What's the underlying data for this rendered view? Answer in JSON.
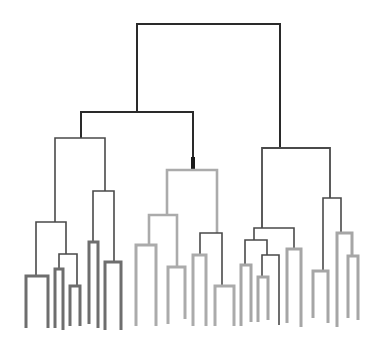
{
  "diagram": {
    "type": "dendrogram",
    "width": 385,
    "height": 350,
    "colors": {
      "root": "#2a2a2a",
      "internal": "#4a4a4a",
      "left_leaf": "#6e6e6e",
      "middle_leaf": "#ababab",
      "right_leaf": "#a6a6a6",
      "stub": "#1a1a1a"
    },
    "links": [
      {
        "id": "root",
        "x1": 137,
        "x2": 280,
        "y": 24,
        "yl": 112,
        "yr": 148,
        "color": "root",
        "w": 2
      },
      {
        "id": "L",
        "x1": 81,
        "x2": 193,
        "y": 112,
        "yl": 138,
        "yr": 170,
        "color": "root",
        "w": 2
      },
      {
        "id": "stub",
        "x1": 193,
        "x2": 193,
        "y": 157,
        "yl": 170,
        "yr": 170,
        "color": "stub",
        "w": 4
      },
      {
        "id": "L1",
        "x1": 55,
        "x2": 105,
        "y": 138,
        "yl": 222,
        "yr": 191,
        "color": "internal",
        "w": 1.6
      },
      {
        "id": "L1a",
        "x1": 36,
        "x2": 66,
        "y": 222,
        "yl": 276,
        "yr": 254,
        "color": "internal",
        "w": 1.6
      },
      {
        "id": "L1a1",
        "x1": 26,
        "x2": 48,
        "y": 276,
        "yl": 328,
        "yr": 328,
        "color": "left_leaf",
        "w": 3
      },
      {
        "id": "L1a2",
        "x1": 59,
        "x2": 77,
        "y": 254,
        "yl": 269,
        "yr": 286,
        "color": "internal",
        "w": 1.6
      },
      {
        "id": "L1a2a",
        "x1": 55,
        "x2": 63,
        "y": 269,
        "yl": 328,
        "yr": 330,
        "color": "left_leaf",
        "w": 3
      },
      {
        "id": "L1a2b",
        "x1": 70,
        "x2": 80,
        "y": 286,
        "yl": 326,
        "yr": 326,
        "color": "left_leaf",
        "w": 3
      },
      {
        "id": "L1b",
        "x1": 93,
        "x2": 114,
        "y": 191,
        "yl": 242,
        "yr": 262,
        "color": "internal",
        "w": 1.6
      },
      {
        "id": "L1b1",
        "x1": 89,
        "x2": 98,
        "y": 242,
        "yl": 324,
        "yr": 328,
        "color": "left_leaf",
        "w": 3
      },
      {
        "id": "L1b2",
        "x1": 105,
        "x2": 121,
        "y": 262,
        "yl": 330,
        "yr": 330,
        "color": "left_leaf",
        "w": 3
      },
      {
        "id": "M",
        "x1": 167,
        "x2": 217,
        "y": 170,
        "yl": 215,
        "yr": 233,
        "color": "middle_leaf",
        "w": 2.6
      },
      {
        "id": "M1",
        "x1": 149,
        "x2": 177,
        "y": 215,
        "yl": 245,
        "yr": 267,
        "color": "middle_leaf",
        "w": 2.6
      },
      {
        "id": "M1a",
        "x1": 136,
        "x2": 156,
        "y": 245,
        "yl": 326,
        "yr": 326,
        "color": "middle_leaf",
        "w": 3
      },
      {
        "id": "M1b",
        "x1": 168,
        "x2": 185,
        "y": 267,
        "yl": 324,
        "yr": 319,
        "color": "middle_leaf",
        "w": 3
      },
      {
        "id": "M2",
        "x1": 200,
        "x2": 222,
        "y": 233,
        "yl": 255,
        "yr": 286,
        "color": "internal",
        "w": 1.6
      },
      {
        "id": "M2a",
        "x1": 193,
        "x2": 206,
        "y": 255,
        "yl": 326,
        "yr": 326,
        "color": "middle_leaf",
        "w": 3
      },
      {
        "id": "M2b",
        "x1": 215,
        "x2": 234,
        "y": 286,
        "yl": 326,
        "yr": 326,
        "color": "middle_leaf",
        "w": 3
      },
      {
        "id": "R",
        "x1": 262,
        "x2": 330,
        "y": 148,
        "yl": 228,
        "yr": 198,
        "color": "internal",
        "w": 1.8
      },
      {
        "id": "R1",
        "x1": 254,
        "x2": 294,
        "y": 228,
        "yl": 240,
        "yr": 249,
        "color": "internal",
        "w": 1.6
      },
      {
        "id": "R1a",
        "x1": 245,
        "x2": 267,
        "y": 240,
        "yl": 265,
        "yr": 255,
        "color": "internal",
        "w": 1.6
      },
      {
        "id": "R1a1",
        "x1": 241,
        "x2": 251,
        "y": 265,
        "yl": 326,
        "yr": 322,
        "color": "right_leaf",
        "w": 3
      },
      {
        "id": "R1a2",
        "x1": 262,
        "x2": 279,
        "y": 255,
        "yl": 277,
        "yr": 325,
        "color": "internal",
        "w": 1.6
      },
      {
        "id": "R1a2a",
        "x1": 258,
        "x2": 268,
        "y": 277,
        "yl": 322,
        "yr": 320,
        "color": "right_leaf",
        "w": 3
      },
      {
        "id": "R1b",
        "x1": 287,
        "x2": 301,
        "y": 249,
        "yl": 323,
        "yr": 327,
        "color": "right_leaf",
        "w": 3
      },
      {
        "id": "R2",
        "x1": 323,
        "x2": 341,
        "y": 198,
        "yl": 271,
        "yr": 233,
        "color": "internal",
        "w": 1.6
      },
      {
        "id": "R2a",
        "x1": 313,
        "x2": 328,
        "y": 271,
        "yl": 318,
        "yr": 323,
        "color": "right_leaf",
        "w": 3
      },
      {
        "id": "R2b",
        "x1": 337,
        "x2": 352,
        "y": 233,
        "yl": 327,
        "yr": 256,
        "color": "right_leaf",
        "w": 3
      },
      {
        "id": "R2b1",
        "x1": 348,
        "x2": 358,
        "y": 256,
        "yl": 318,
        "yr": 320,
        "color": "right_leaf",
        "w": 3
      }
    ],
    "leaf_count": 30
  }
}
